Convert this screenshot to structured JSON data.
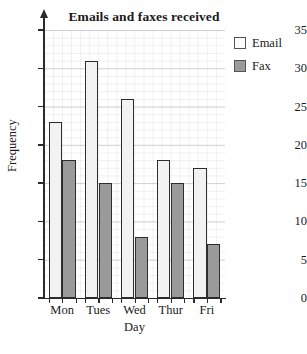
{
  "chart_data": {
    "type": "bar",
    "title": "Emails and faxes received",
    "xlabel": "Day",
    "ylabel": "Frequency",
    "categories": [
      "Mon",
      "Tues",
      "Wed",
      "Thur",
      "Fri"
    ],
    "series": [
      {
        "name": "Email",
        "values": [
          23,
          31,
          26,
          18,
          17
        ],
        "color": "#f2f2f2"
      },
      {
        "name": "Fax",
        "values": [
          18,
          15,
          8,
          15,
          7
        ],
        "color": "#9a9a9a"
      }
    ],
    "ylim": [
      0,
      35
    ],
    "ytick_labels": [
      "0",
      "5",
      "10",
      "15",
      "20",
      "25",
      "30",
      "35"
    ],
    "ytick_values": [
      0,
      5,
      10,
      15,
      20,
      25,
      30,
      35
    ],
    "grid": true,
    "legend_position": "top-right",
    "y_axis_arrow": true
  },
  "legend": {
    "entries": [
      {
        "label": "Email",
        "swatch": "email"
      },
      {
        "label": "Fax",
        "swatch": "fax"
      }
    ]
  }
}
